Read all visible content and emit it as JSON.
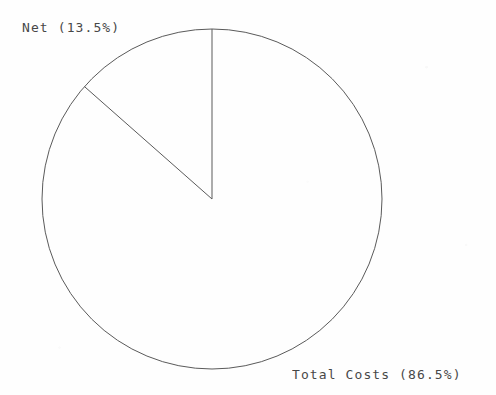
{
  "chart_data": {
    "type": "pie",
    "title": "",
    "subtitle": "",
    "xlabel": "",
    "ylabel": "",
    "grid": false,
    "legend_position": "none",
    "label_style": "outside-adjacent-to-slice",
    "start_angle_deg": 90,
    "direction": "counterclockwise",
    "slices": [
      {
        "name": "Net",
        "percent": 13.5,
        "label": "Net (13.5%)",
        "value_text": "13.5%",
        "fill": "none",
        "stroke": "#5a5a5a"
      },
      {
        "name": "Total Costs",
        "percent": 86.5,
        "label": "Total Costs (86.5%)",
        "value_text": "86.5%",
        "fill": "none",
        "stroke": "#5a5a5a"
      }
    ],
    "categories": [
      "Net",
      "Total Costs"
    ],
    "values": [
      13.5,
      86.5
    ],
    "labels": [
      "Net (13.5%)",
      "Total Costs (86.5%)"
    ],
    "geometry": {
      "center_x": 212,
      "center_y": 199,
      "radius": 170
    },
    "colors": {
      "background": "#fefefe",
      "stroke": "#5a5a5a",
      "text": "#2e2e2e"
    }
  },
  "labels": {
    "net": "Net (13.5%)",
    "total_costs": "Total Costs (86.5%)"
  }
}
